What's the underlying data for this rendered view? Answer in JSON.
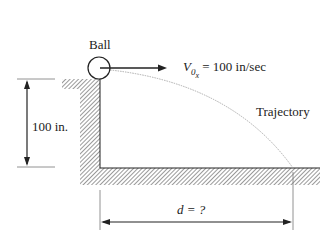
{
  "diagram": {
    "ball_label": "Ball",
    "velocity": {
      "symbol": "V",
      "subscript": "0",
      "subsubscript": "x",
      "value_text": "= 100 in/sec"
    },
    "trajectory_label": "Trajectory",
    "height_label": "100 in.",
    "distance_label": {
      "symbol": "d",
      "rest": " = ?"
    },
    "colors": {
      "line": "#222222",
      "hatch": "#555555",
      "trajectory": "#999999"
    }
  }
}
